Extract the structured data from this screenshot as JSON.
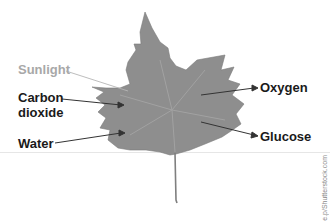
{
  "diagram": {
    "inputs": [
      "Sunlight",
      "Carbon dioxide",
      "Water"
    ],
    "outputs": [
      "Oxygen",
      "Glucose"
    ]
  },
  "labels": {
    "sunlight": "Sunlight",
    "carbon_line1": "Carbon",
    "carbon_line2": "dioxide",
    "water": "Water",
    "oxygen": "Oxygen",
    "glucose": "Glucose"
  },
  "watermark": "e.p/Shutterstock.com",
  "colors": {
    "leaf": "#8e8e8e",
    "label": "#1a1a1a",
    "sunlight_label": "#a8a8a8"
  }
}
